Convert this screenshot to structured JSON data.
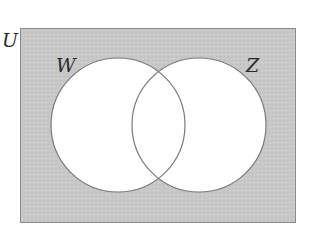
{
  "diagram": {
    "type": "venn",
    "universe_label": "U",
    "sets": [
      {
        "label": "W",
        "cx": 118,
        "cy": 125,
        "r": 67
      },
      {
        "label": "Z",
        "cx": 199,
        "cy": 125,
        "r": 67
      }
    ],
    "shaded_region": "complement of W union Z",
    "colors": {
      "shade": "#c9c9c9",
      "outline": "#7a7a7a",
      "inside": "#ffffff"
    }
  }
}
